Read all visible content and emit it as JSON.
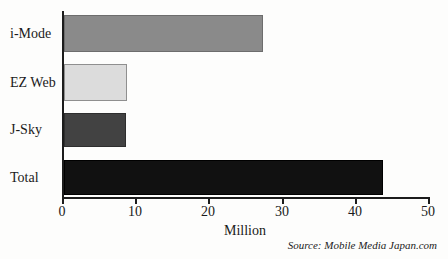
{
  "chart_data": {
    "type": "bar",
    "orientation": "horizontal",
    "title": "",
    "categories": [
      "i-Mode",
      "EZ Web",
      "J-Sky",
      "Total"
    ],
    "values": [
      27.2,
      8.6,
      8.5,
      43.6
    ],
    "bar_colors": [
      "#8a8a8a",
      "#dcdcdc",
      "#424242",
      "#111111"
    ],
    "bar_border_colors": [
      "#6d6d6d",
      "#8f8f8f",
      "#2e2e2e",
      "#000000"
    ],
    "xlabel": "Million",
    "xlim": [
      0,
      50
    ],
    "xticks": [
      0,
      10,
      20,
      30,
      40,
      50
    ],
    "xtick_labels": [
      "0",
      "10",
      "20",
      "30",
      "40",
      "50"
    ],
    "grid": false,
    "legend": "none",
    "source": "Source: Mobile Media Japan.com",
    "axis_color": "#1c1c1c",
    "background_color": "#fdfdfc"
  }
}
